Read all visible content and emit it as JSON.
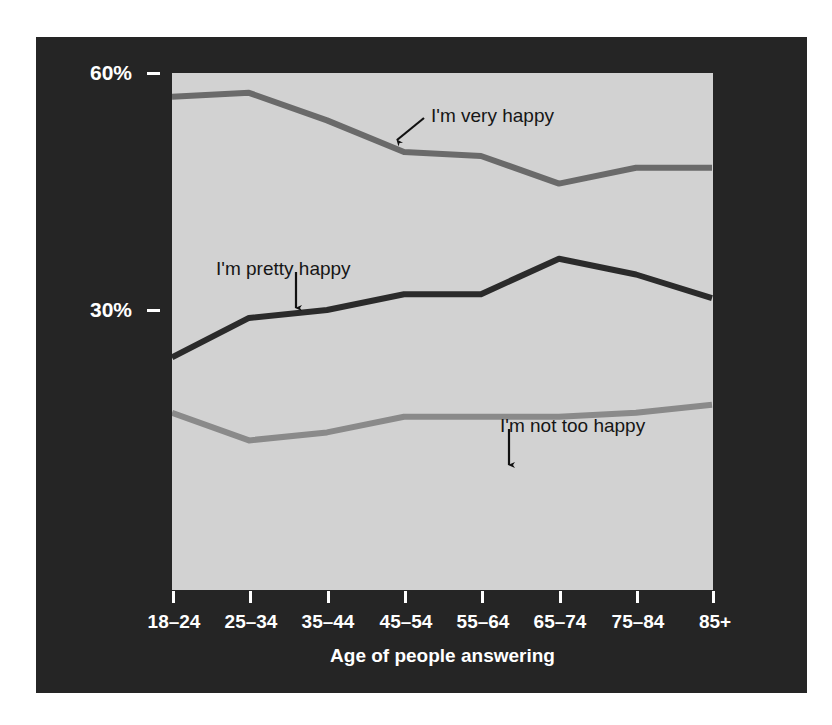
{
  "figure": {
    "background_color": "#ffffff",
    "panel_color": "#252525",
    "plot_background_color": "#d2d2d2"
  },
  "chart_data": {
    "type": "line",
    "title": "",
    "xlabel": "Age of people answering",
    "ylabel": "",
    "categories": [
      "18–24",
      "25–34",
      "35–44",
      "45–54",
      "55–64",
      "65–74",
      "75–84",
      "85+"
    ],
    "ylim": [
      0,
      63
    ],
    "yticks": [
      30,
      60
    ],
    "ytick_labels": [
      "30%",
      "60%"
    ],
    "grid": false,
    "legend_position": "inline-annotations",
    "series": [
      {
        "name": "I'm very happy",
        "color": "#6a6a6a",
        "values": [
          57.0,
          57.5,
          54.0,
          50.0,
          49.5,
          46.0,
          48.0,
          48.0
        ]
      },
      {
        "name": "I'm pretty happy",
        "color": "#2b2b2b",
        "values": [
          24.0,
          29.0,
          30.0,
          32.0,
          32.0,
          36.5,
          34.5,
          31.5
        ]
      },
      {
        "name": "I'm not too happy",
        "color": "#8a8a8a",
        "values": [
          17.0,
          13.5,
          14.5,
          16.5,
          16.5,
          16.5,
          17.0,
          18.0
        ]
      }
    ],
    "annotations": [
      {
        "id": "very-happy",
        "text": "I'm very happy",
        "label_x": 431,
        "label_y": 105,
        "arrow": {
          "x1": 424,
          "y1": 118,
          "x2": 397,
          "y2": 140,
          "style": "diagonal"
        }
      },
      {
        "id": "pretty-happy",
        "text": "I'm pretty happy",
        "label_x": 216,
        "label_y": 258,
        "arrow": {
          "x1": 296,
          "y1": 272,
          "x2": 296,
          "y2": 308,
          "style": "vertical"
        }
      },
      {
        "id": "not-too-happy",
        "text": "I'm not too happy",
        "label_x": 500,
        "label_y": 415,
        "arrow": {
          "x1": 509,
          "y1": 429,
          "x2": 509,
          "y2": 465,
          "style": "vertical"
        }
      }
    ]
  },
  "axis": {
    "y_tick_labels": [
      "60%",
      "30%"
    ],
    "x_tick_labels": [
      "18–24",
      "25–34",
      "35–44",
      "45–54",
      "55–64",
      "65–74",
      "75–84",
      "85+"
    ],
    "x_axis_title": "Age of people answering"
  }
}
